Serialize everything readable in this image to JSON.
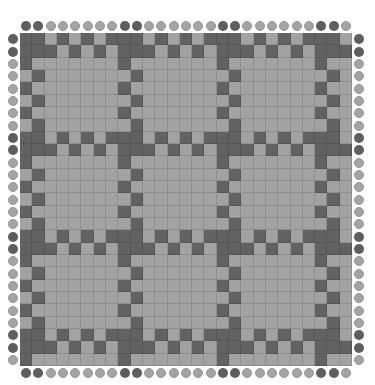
{
  "pattern": {
    "size": 27,
    "period": 8,
    "colors": {
      "dark": "#626262",
      "light": "#a2a2a2",
      "circle_dark": "#5e5e5e",
      "circle_light": "#a4a4a4",
      "background": "#ffffff"
    },
    "edge_circles": {
      "top": "DDLLLLLLDDLLLLLLDDLLLLLLDDL",
      "bottom": "DDLLLLLLDDLLLLLLDDLLLLLLDDL",
      "left": "DDLLLLLLDDLLLLLLDDLLLLLLDDL",
      "right": "DDLLLLLLDDLLLLLLDDLLLLLLDDL"
    },
    "row_types": {
      "0": "DDLDLDLD",
      "1": "DDDLDLDL",
      "2": "DLLLLLLL",
      "3": "LDLLLLLL",
      "4": "DLLLLLLL",
      "5": "LDLLLLLL",
      "6": "DLLLLLLL",
      "7": "LDLLLLLL"
    }
  }
}
